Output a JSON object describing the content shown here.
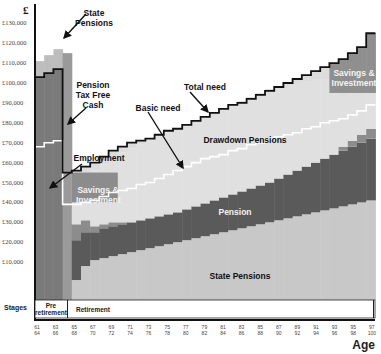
{
  "chart_data": {
    "type": "area",
    "title": "",
    "ylabel": "£",
    "xlabel": "Age",
    "ylim": [
      0,
      130000
    ],
    "yticks": [
      "£130,000",
      "£120,000",
      "£110,000",
      "£100,000",
      "£90,000",
      "£80,000",
      "£70,000",
      "£60,000",
      "£50,000",
      "£40,000",
      "£30,000",
      "£20,000",
      "£10,000"
    ],
    "xticks": [
      {
        "top": "61",
        "bottom": "64"
      },
      {
        "top": "63",
        "bottom": "66"
      },
      {
        "top": "65",
        "bottom": "68"
      },
      {
        "top": "67",
        "bottom": "70"
      },
      {
        "top": "69",
        "bottom": "72"
      },
      {
        "top": "71",
        "bottom": "74"
      },
      {
        "top": "73",
        "bottom": "76"
      },
      {
        "top": "75",
        "bottom": "78"
      },
      {
        "top": "77",
        "bottom": "80"
      },
      {
        "top": "79",
        "bottom": "82"
      },
      {
        "top": "81",
        "bottom": "84"
      },
      {
        "top": "83",
        "bottom": "86"
      },
      {
        "top": "85",
        "bottom": "88"
      },
      {
        "top": "87",
        "bottom": "90"
      },
      {
        "top": "89",
        "bottom": "92"
      },
      {
        "top": "91",
        "bottom": "94"
      },
      {
        "top": "93",
        "bottom": "96"
      },
      {
        "top": "95",
        "bottom": "98"
      },
      {
        "top": "97",
        "bottom": "100"
      }
    ],
    "stages": [
      {
        "label": "Pre retirement",
        "from_age": 61,
        "to_age": 63
      },
      {
        "label": "Retirement",
        "from_age": 65,
        "to_age": 97
      }
    ],
    "stages_label": "Stages",
    "ages": [
      61,
      62,
      63,
      64,
      65,
      66,
      67,
      68,
      69,
      70,
      71,
      72,
      73,
      74,
      75,
      76,
      77,
      78,
      79,
      80,
      81,
      82,
      83,
      84,
      85,
      86,
      87,
      88,
      89,
      90,
      91,
      92,
      93,
      94,
      95,
      96,
      97
    ],
    "series": [
      {
        "name": "State Pensions",
        "color": "#c8c8c8",
        "values": [
          0,
          0,
          0,
          0,
          10000,
          17000,
          20000,
          21000,
          22000,
          23000,
          24000,
          25000,
          26000,
          27000,
          28000,
          29000,
          30000,
          31000,
          32000,
          33000,
          34000,
          35000,
          36000,
          37000,
          38000,
          39000,
          40000,
          41000,
          42000,
          43000,
          44000,
          45000,
          46000,
          47000,
          48000,
          49000,
          50000
        ]
      },
      {
        "name": "Pension",
        "color": "#5a5a5a",
        "values": [
          0,
          0,
          0,
          0,
          20000,
          17000,
          14000,
          15000,
          15000,
          15000,
          15000,
          15000,
          15000,
          15000,
          15000,
          15000,
          15500,
          16000,
          16500,
          17000,
          17500,
          18000,
          18500,
          19000,
          19500,
          20000,
          21000,
          22000,
          23000,
          24000,
          25000,
          26000,
          27000,
          28000,
          29000,
          30000,
          31000
        ]
      },
      {
        "name": "Savings & Investment",
        "color": "#8c8c8c",
        "values": [
          0,
          0,
          0,
          0,
          8000,
          6000,
          3000,
          2000,
          2000,
          1000,
          0,
          0,
          0,
          0,
          0,
          0,
          0,
          0,
          0,
          0,
          0,
          0,
          0,
          0,
          0,
          0,
          0,
          0,
          0,
          0,
          0,
          0,
          0,
          2000,
          3000,
          4000,
          5000
        ]
      },
      {
        "name": "Drawdown Pensions",
        "color": "#e0e0e0",
        "values": [
          0,
          0,
          0,
          0,
          20000,
          22000,
          28000,
          30000,
          33000,
          35000,
          37000,
          38000,
          39000,
          40000,
          41000,
          42000,
          42500,
          43000,
          43500,
          44000,
          44500,
          45000,
          45500,
          46000,
          46500,
          47000,
          46000,
          45000,
          44000,
          43000,
          42000,
          40000,
          38000,
          26000,
          27000,
          28000,
          29000
        ]
      },
      {
        "name": "Employment",
        "color": "#7a7a7a",
        "values": [
          103000,
          105000,
          107000,
          0,
          0,
          0,
          0,
          0,
          0,
          0,
          0,
          0,
          0,
          0,
          0,
          0,
          0,
          0,
          0,
          0,
          0,
          0,
          0,
          0,
          0,
          0,
          0,
          0,
          0,
          0,
          0,
          0,
          0,
          0,
          0,
          0,
          0
        ]
      },
      {
        "name": "State Pensions (pre-retirement top-up)",
        "color": "#bdbdbd",
        "values": [
          8000,
          9000,
          10000,
          0,
          0,
          0,
          0,
          0,
          0,
          0,
          0,
          0,
          0,
          0,
          0,
          0,
          0,
          0,
          0,
          0,
          0,
          0,
          0,
          0,
          0,
          0,
          0,
          0,
          0,
          0,
          0,
          0,
          0,
          0,
          0,
          0,
          0
        ]
      },
      {
        "name": "Pension Tax Free Cash",
        "color": "#9a9a9a",
        "values": [
          0,
          0,
          0,
          115000,
          0,
          0,
          0,
          0,
          0,
          0,
          0,
          0,
          0,
          0,
          0,
          0,
          0,
          0,
          0,
          0,
          0,
          0,
          0,
          0,
          0,
          0,
          0,
          0,
          0,
          0,
          0,
          0,
          0,
          0,
          0,
          0,
          0
        ]
      }
    ],
    "lines": [
      {
        "name": "Total need",
        "color": "#111111",
        "values": [
          103000,
          105000,
          107000,
          55000,
          56000,
          58000,
          60000,
          63000,
          66000,
          68000,
          70000,
          71000,
          72000,
          74000,
          76000,
          77000,
          79000,
          81000,
          83000,
          85000,
          87000,
          89000,
          90000,
          92000,
          94000,
          96000,
          98000,
          100000,
          102000,
          104000,
          106000,
          108000,
          110000,
          112000,
          115000,
          118000,
          125000
        ]
      },
      {
        "name": "Basic need",
        "color": "#ffffff",
        "values": [
          68000,
          70000,
          71000,
          39000,
          39000,
          40000,
          41000,
          43000,
          45000,
          46000,
          47000,
          49000,
          50000,
          52000,
          54000,
          56000,
          58000,
          60000,
          62000,
          63000,
          64000,
          66000,
          67000,
          69000,
          70000,
          72000,
          73000,
          74000,
          75000,
          77000,
          78000,
          80000,
          81000,
          82000,
          84000,
          86000,
          89000
        ]
      }
    ],
    "annotations": [
      {
        "text": "State Pensions",
        "x": 92,
        "y": 8
      },
      {
        "text": "Pension Tax Free Cash",
        "x": 92,
        "y": 80
      },
      {
        "text": "Employment",
        "x": 88,
        "y": 152
      },
      {
        "text": "Savings & Investment",
        "x": 87,
        "y": 183
      },
      {
        "text": "Total need",
        "x": 208,
        "y": 82
      },
      {
        "text": "Basic need",
        "x": 160,
        "y": 102
      },
      {
        "text": "Drawdown Pensions",
        "x": 250,
        "y": 135
      },
      {
        "text": "Pension",
        "x": 240,
        "y": 207
      },
      {
        "text": "State Pensions",
        "x": 250,
        "y": 272
      },
      {
        "text": "Savings & Investment",
        "x": 352,
        "y": 72
      }
    ],
    "grid": false,
    "legend": "none (inline annotations)"
  },
  "labels": {
    "currency": "£",
    "stages": "Stages",
    "pre_retirement": "Pre retirement",
    "retirement": "Retirement",
    "age": "Age",
    "ann_state_pensions_top": "State Pensions",
    "ann_tax_free_cash": "Pension Tax Free Cash",
    "ann_employment": "Employment",
    "ann_savings_left": "Savings & Investment",
    "ann_total_need": "Total need",
    "ann_basic_need": "Basic need",
    "ann_drawdown": "Drawdown Pensions",
    "ann_pension": "Pension",
    "ann_state_pensions_bottom": "State Pensions",
    "ann_savings_right": "Savings & Investment"
  }
}
